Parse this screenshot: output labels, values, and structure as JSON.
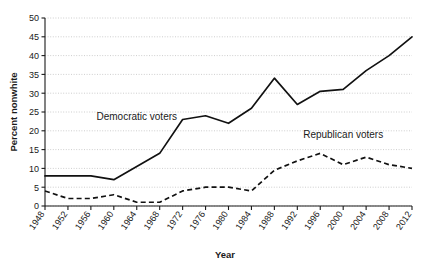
{
  "chart_data": {
    "type": "line",
    "title": "",
    "xlabel": "Year",
    "ylabel": "Percent nonwhite",
    "x": [
      1948,
      1952,
      1956,
      1960,
      1964,
      1968,
      1972,
      1976,
      1980,
      1984,
      1988,
      1992,
      1996,
      2000,
      2004,
      2008,
      2012
    ],
    "xtick_labels": [
      "1948",
      "1952",
      "1956",
      "1960",
      "1964",
      "1968",
      "1972",
      "1976",
      "1980",
      "1984",
      "1988",
      "1992",
      "1996",
      "2000",
      "2004",
      "2008",
      "2012"
    ],
    "ytick_labels": [
      "0",
      "5",
      "10",
      "15",
      "20",
      "25",
      "30",
      "35",
      "40",
      "45",
      "50"
    ],
    "yticks": [
      0,
      5,
      10,
      15,
      20,
      25,
      30,
      35,
      40,
      45,
      50
    ],
    "ylim": [
      0,
      50
    ],
    "xlim": [
      1948,
      2012
    ],
    "grid": true,
    "legend_position": "inline-annotations",
    "series": [
      {
        "name": "Democratic voters",
        "style": "solid",
        "color": "#111111",
        "label_x": 1964,
        "label_y": 23,
        "values": [
          8,
          8,
          8,
          7,
          10.5,
          14,
          23,
          24,
          22,
          26,
          34,
          27,
          30.5,
          31,
          36,
          40,
          45
        ]
      },
      {
        "name": "Republican voters",
        "style": "dashed",
        "color": "#111111",
        "label_x": 2000,
        "label_y": 18,
        "values": [
          4,
          2,
          2,
          3,
          1,
          1,
          4,
          5,
          5,
          4,
          9.5,
          12,
          14,
          11,
          13,
          11,
          10
        ]
      }
    ]
  }
}
